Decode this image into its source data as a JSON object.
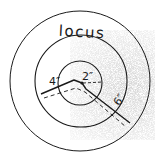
{
  "diagram": {
    "title": "locus",
    "labels": {
      "inner": "2″",
      "middle": "4″",
      "outer": "6″"
    },
    "colors": {
      "stroke": "#1a1a1a",
      "background": "#ffffff",
      "stipple": "#9a9a9a"
    }
  }
}
